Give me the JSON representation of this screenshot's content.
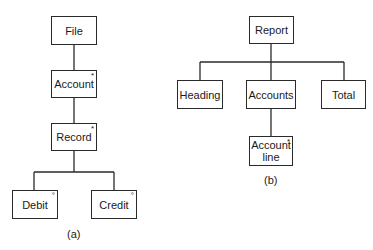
{
  "diagrams": [
    {
      "caption": "(a)",
      "nodes": [
        {
          "id": "file",
          "label": "File",
          "marker": ""
        },
        {
          "id": "account",
          "label": "Account",
          "marker": "*"
        },
        {
          "id": "record",
          "label": "Record",
          "marker": "*"
        },
        {
          "id": "debit",
          "label": "Debit",
          "marker": "°"
        },
        {
          "id": "credit",
          "label": "Credit",
          "marker": "°"
        }
      ],
      "edges": [
        [
          "file",
          "account"
        ],
        [
          "account",
          "record"
        ],
        [
          "record",
          "debit"
        ],
        [
          "record",
          "credit"
        ]
      ]
    },
    {
      "caption": "(b)",
      "nodes": [
        {
          "id": "report",
          "label": "Report",
          "marker": ""
        },
        {
          "id": "heading",
          "label": "Heading",
          "marker": ""
        },
        {
          "id": "accounts",
          "label": "Accounts",
          "marker": ""
        },
        {
          "id": "total",
          "label": "Total",
          "marker": ""
        },
        {
          "id": "account_line",
          "label": "Account line",
          "marker": "*"
        }
      ],
      "edges": [
        [
          "report",
          "heading"
        ],
        [
          "report",
          "accounts"
        ],
        [
          "report",
          "total"
        ],
        [
          "accounts",
          "account_line"
        ]
      ]
    }
  ],
  "a": {
    "caption": "(a)",
    "file": "File",
    "account": "Account",
    "account_mark": "*",
    "record": "Record",
    "record_mark": "*",
    "debit": "Debit",
    "debit_mark": "°",
    "credit": "Credit",
    "credit_mark": "°"
  },
  "b": {
    "caption": "(b)",
    "report": "Report",
    "heading": "Heading",
    "accounts": "Accounts",
    "total": "Total",
    "account_line_1": "Account",
    "account_line_2": "line",
    "account_line_mark": "*"
  }
}
